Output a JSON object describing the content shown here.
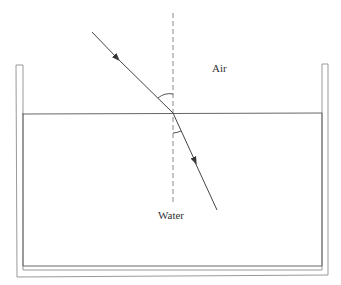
{
  "diagram": {
    "labels": {
      "air": "Air",
      "water": "Water"
    },
    "colors": {
      "line": "#555555",
      "tank_outer": "#888888",
      "tank_inner": "#555555",
      "text": "#333333",
      "background": "#ffffff"
    },
    "elements": {
      "incident_ray": {
        "from": [
          92,
          32
        ],
        "to": [
          173,
          113
        ],
        "direction": "toward surface"
      },
      "refracted_ray": {
        "from": [
          173,
          113
        ],
        "to": [
          217,
          210
        ],
        "direction": "into water"
      },
      "normal": {
        "x": 173,
        "y_start": 13,
        "y_end": 205,
        "style": "dashed"
      },
      "water_surface": {
        "y": 113,
        "x_start": 22,
        "x_end": 322
      },
      "angle_of_incidence_arc": true,
      "angle_of_refraction_arc": true
    }
  }
}
